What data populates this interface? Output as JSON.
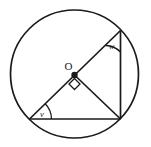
{
  "figure": {
    "type": "circle-geometry-diagram",
    "background_color": "#ffffff",
    "stroke_color": "#1a1a1a",
    "circle": {
      "center_label": "O",
      "cx": 74.5,
      "cy": 74,
      "r": 64,
      "stroke_width": 1.6
    },
    "points": {
      "center": {
        "label": "O",
        "x": 74.5,
        "y": 74
      },
      "bottom_left": {
        "x": 29.5,
        "y": 119
      },
      "top_right": {
        "x": 120.5,
        "y": 30.5
      },
      "bottom_right": {
        "x": 120.5,
        "y": 119
      }
    },
    "segments": [
      {
        "name": "diameter",
        "from": "bottom_left",
        "to": "top_right"
      },
      {
        "name": "base-chord",
        "from": "bottom_left",
        "to": "bottom_right"
      },
      {
        "name": "right-chord",
        "from": "top_right",
        "to": "bottom_right"
      },
      {
        "name": "radius-to-bottom-right",
        "from": "center",
        "to": "bottom_right"
      }
    ],
    "angles": [
      {
        "name": "angle-v",
        "label": "v",
        "vertex": "bottom_left",
        "label_x": 42,
        "label_y": 116
      },
      {
        "name": "angle-w",
        "label": "w",
        "vertex": "top_right",
        "label_x": 111,
        "label_y": 49
      },
      {
        "name": "right-angle-at-center",
        "label": "",
        "vertex": "center",
        "marker": "square"
      }
    ],
    "labels": {
      "center_label": "O",
      "center_label_x": 68,
      "center_label_y": 70,
      "angle_v": "v",
      "angle_w": "w"
    }
  }
}
